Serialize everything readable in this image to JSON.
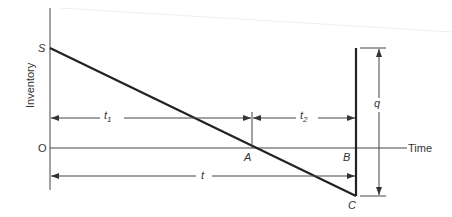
{
  "diagram": {
    "type": "inventory-model",
    "axes": {
      "y_label": "Inventory",
      "x_label": "Time",
      "origin_label": "O"
    },
    "points": {
      "S": "S",
      "A": "A",
      "B": "B",
      "C": "C"
    },
    "dimensions": {
      "t1": {
        "base": "t",
        "sub": "1"
      },
      "t2": {
        "base": "t",
        "sub": "2"
      },
      "t": {
        "base": "t"
      },
      "q": {
        "base": "q"
      }
    },
    "colors": {
      "line": "#222222",
      "thin": "#444444",
      "text": "#333333",
      "bg": "#ffffff"
    }
  }
}
